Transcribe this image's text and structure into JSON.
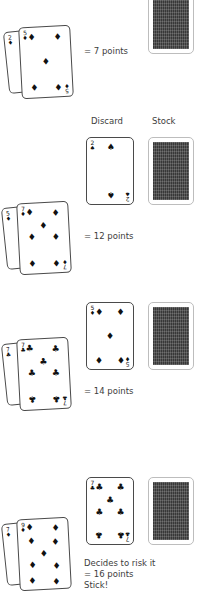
{
  "columns": {
    "discard_label": "Discard",
    "stock_label": "Stock"
  },
  "glyphs": {
    "diamond": "♦",
    "club": "♣",
    "spade": "♠",
    "heart": "♥"
  },
  "rounds": [
    {
      "id": "round-1",
      "hand": [
        {
          "rank": "2",
          "suit": "♦"
        },
        {
          "rank": "5",
          "suit": "♦"
        }
      ],
      "discard": null,
      "stock": "card-back",
      "note": "= 7 points"
    },
    {
      "id": "round-2",
      "hand": [
        {
          "rank": "5",
          "suit": "♦"
        },
        {
          "rank": "7",
          "suit": "♦"
        }
      ],
      "discard": {
        "rank": "2",
        "suit": "♠"
      },
      "stock": "card-back",
      "note": "= 12 points"
    },
    {
      "id": "round-3",
      "hand": [
        {
          "rank": "7",
          "suit": "♣"
        },
        {
          "rank": "7",
          "suit": "♣"
        }
      ],
      "discard": {
        "rank": "5",
        "suit": "♦"
      },
      "stock": "card-back",
      "note": "= 14 points"
    },
    {
      "id": "round-4",
      "hand": [
        {
          "rank": "7",
          "suit": "♦"
        },
        {
          "rank": "9",
          "suit": "♦"
        }
      ],
      "discard": {
        "rank": "7",
        "suit": "♣"
      },
      "stock": "card-back",
      "note_line1": "Decides to risk it",
      "note_line2": "= 16 points",
      "note_line3": "Stick!"
    }
  ],
  "colors": {
    "ink": "#3a3a3a",
    "card_outline": "#4a4a4a",
    "card_back_fill": "#4a4a4a",
    "card_back_border": "#bdbdbd",
    "page_background": "#ffffff"
  }
}
